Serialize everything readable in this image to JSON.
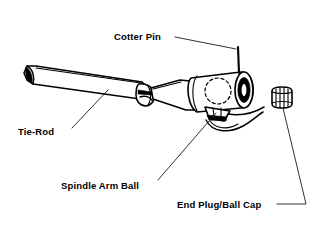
{
  "diagram": {
    "background_color": "#ffffff",
    "line_color": "#000000",
    "labels": [
      {
        "id": "cotter-pin",
        "text": "Cotter Pin",
        "x": 114,
        "y": 40,
        "leader": "M 175,37 L 236,49"
      },
      {
        "id": "tie-rod",
        "text": "Tie-Rod",
        "x": 18,
        "y": 135,
        "leader": "M 72,128 L 108,90"
      },
      {
        "id": "spindle-arm-ball",
        "text": "Spindle Arm Ball",
        "x": 61,
        "y": 189,
        "leader": "M 158,180 L 216,113"
      },
      {
        "id": "end-plug-ball-cap",
        "text": "End Plug/Ball Cap",
        "x": 177,
        "y": 208,
        "leader": "M 277,204 L 306,204 L 283,108"
      }
    ],
    "parts": [
      {
        "id": "tie-rod-shaft",
        "name": "Tie-Rod",
        "description": "Tapered tubular rod running from lower-left to center"
      },
      {
        "id": "rod-clamp",
        "name": "Clamp Nut",
        "description": "Adjuster clamp collar with bolt on the rod"
      },
      {
        "id": "socket-housing",
        "name": "Socket Housing",
        "description": "Cylindrical ball-joint housing at right with open bore"
      },
      {
        "id": "spindle-arm-ball",
        "name": "Spindle Arm Ball",
        "description": "Ball shown as hidden dashed circle inside housing"
      },
      {
        "id": "ball-stud-boot",
        "name": "Boot / Seal",
        "description": "Curved seal lines below the ball joint"
      },
      {
        "id": "cotter-pin",
        "name": "Cotter Pin",
        "description": "Thin vertical pin above the housing"
      },
      {
        "id": "end-plug",
        "name": "End Plug/Ball Cap",
        "description": "Small knurled cylindrical cap detached at far right"
      }
    ]
  }
}
